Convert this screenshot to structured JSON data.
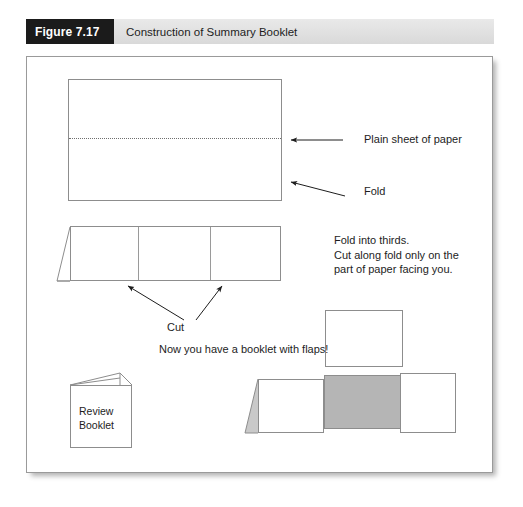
{
  "caption": {
    "number": "Figure 7.17",
    "title": "Construction of Summary Booklet"
  },
  "colors": {
    "caption_block_bg": "#1b1b1b",
    "caption_bar_bg": "#e2e2e2",
    "panel_border": "#9a9a9a",
    "shape_stroke": "#8d8d8d",
    "gray_panel": "#b5b5b5",
    "text": "#1d1d1d"
  },
  "labels": {
    "plain_sheet": "Plain sheet of paper",
    "fold": "Fold",
    "cut": "Cut",
    "instructions": "Fold into thirds.\nCut along fold only on the\npart of paper facing you.",
    "booklet_with_flaps": "Now you have a booklet with flaps!",
    "review_booklet": "Review\nBooklet"
  },
  "steps": [
    {
      "name": "plain-sheet-of-paper",
      "description": "Rectangular sheet with a horizontal dotted fold line across the middle",
      "callouts": [
        "Plain sheet of paper",
        "Fold"
      ]
    },
    {
      "name": "folded-into-thirds",
      "description": "Long strip divided into three panels with a triangular flap on the left; two arrows point to the two fold/cut divisions",
      "callouts": [
        "Cut",
        "Fold into thirds.",
        "Cut along fold only on the",
        "part of paper facing you."
      ]
    },
    {
      "name": "finished-booklet",
      "description": "Standing booklet with flaps: an upper white panel plus a lower strip with a gray center flap",
      "callouts": [
        "Now you have a booklet with flaps!"
      ]
    },
    {
      "name": "review-booklet",
      "description": "Small closed booklet labeled Review Booklet with an open cover flap on top",
      "callouts": [
        "Review",
        "Booklet"
      ]
    }
  ]
}
